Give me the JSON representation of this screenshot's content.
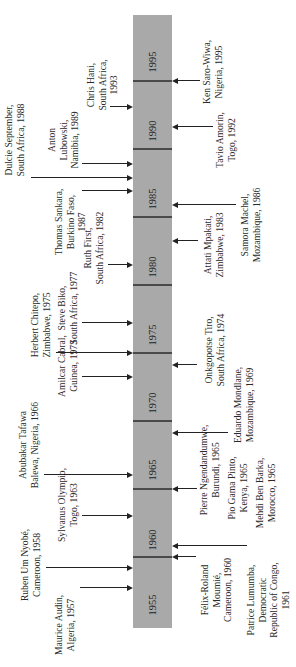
{
  "timeline": {
    "orientation": "rotated",
    "start_year": 1955,
    "end_year": 1999,
    "tick_years": [
      1960,
      1965,
      1970,
      1975,
      1980,
      1985,
      1990,
      1995
    ],
    "year_labels": [
      "1955",
      "1960",
      "1965",
      "1970",
      "1975",
      "1980",
      "1985",
      "1990",
      "1995"
    ],
    "bar_color": "#a9a9a9",
    "tick_color": "#4a4a4a"
  },
  "events": [
    {
      "side": "left",
      "year": 1957.7,
      "lines": [
        "Maurice Audin,",
        "Algeria, 1957"
      ]
    },
    {
      "side": "left",
      "year": 1959.2,
      "lines": [
        "Ruben Um Nyobé,",
        "Cameroon, 1958"
      ]
    },
    {
      "side": "left",
      "year": 1963.0,
      "lines": [
        "Sylvanus Olympio,",
        "Togo, 1963"
      ]
    },
    {
      "side": "left",
      "year": 1966.0,
      "lines": [
        "Abubakar Tafawa",
        "Balewa, Nigeria, 1966"
      ]
    },
    {
      "side": "left",
      "year": 1973.2,
      "lines": [
        "Amilcar Cabral,",
        "Guinea, 1973"
      ]
    },
    {
      "side": "left",
      "year": 1975.0,
      "lines": [
        "Herbert Chitepo,",
        "Zimbabwe, 1975"
      ]
    },
    {
      "side": "left",
      "year": 1977.2,
      "lines": [
        "Steve Biko,",
        "South Africa, 1977"
      ]
    },
    {
      "side": "left",
      "year": 1981.5,
      "lines": [
        "Ruth First,",
        "South Africa, 1982"
      ]
    },
    {
      "side": "left",
      "year": 1986.9,
      "lines": [
        "Thomas Sankara,",
        "Burkino Faso,",
        "1987"
      ]
    },
    {
      "side": "left",
      "year": 1987.9,
      "lines": [
        "Dulcie September,",
        "South Africa, 1988"
      ]
    },
    {
      "side": "left",
      "year": 1988.9,
      "lines": [
        "Anton",
        "Lubowski,",
        "Namibia, 1989"
      ]
    },
    {
      "side": "left",
      "year": 1993.1,
      "lines": [
        "Chris Hani,",
        "South Africa,",
        "1993"
      ]
    },
    {
      "side": "right",
      "year": 1960.0,
      "lines": [
        "Félix-Roland",
        "Moumié,",
        "Cameroon, 1960"
      ]
    },
    {
      "side": "right",
      "year": 1960.8,
      "lines": [
        "Patrice Lumumba,",
        "Democratic",
        "Republic of Congo,",
        "1961"
      ]
    },
    {
      "side": "right",
      "year": 1965.0,
      "lines": [
        "Pierre Ngendandumwe,",
        "Burundi, 1965"
      ]
    },
    {
      "side": "right",
      "year": null,
      "lines": [
        "Pio Gama Pinto,",
        "Kenya, 1965"
      ]
    },
    {
      "side": "right",
      "year": null,
      "lines": [
        "Mehdi Ben Barka,",
        "Morocco, 1965"
      ]
    },
    {
      "side": "right",
      "year": 1969.1,
      "lines": [
        "Eduardo Mondlane,",
        "Mozambique, 1969"
      ]
    },
    {
      "side": "right",
      "year": 1974.1,
      "lines": [
        "Onkgopotse Tiro,",
        "South Africa, 1974"
      ]
    },
    {
      "side": "right",
      "year": 1983.2,
      "lines": [
        "Attati Mpakati,",
        "Zimbabwe, 1983"
      ]
    },
    {
      "side": "right",
      "year": 1985.9,
      "lines": [
        "Samora Machel,",
        "Mozambique, 1986"
      ]
    },
    {
      "side": "right",
      "year": 1991.6,
      "lines": [
        "Tavio Amorin,",
        "Togo, 1992"
      ]
    },
    {
      "side": "right",
      "year": 1995.0,
      "lines": [
        "Ken Saro-Wiwa,",
        "Nigeria, 1995"
      ]
    }
  ]
}
